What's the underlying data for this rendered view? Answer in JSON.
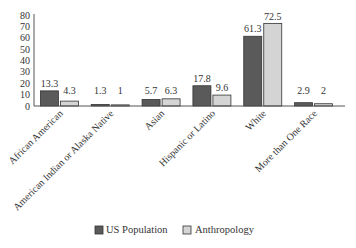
{
  "chart_data": {
    "type": "bar",
    "title": "",
    "xlabel": "",
    "ylabel": "",
    "ylim": [
      0,
      80
    ],
    "yticks": [
      0,
      10,
      20,
      30,
      40,
      50,
      60,
      70,
      80
    ],
    "grid": false,
    "legend_position": "bottom-center",
    "categories": [
      "African American",
      "American Indian or Alaska Native",
      "Asian",
      "Hispanic or Latino",
      "White",
      "More than One Race"
    ],
    "series": [
      {
        "name": "US Population",
        "color": "#5a5a5a",
        "values": [
          13.3,
          1.3,
          5.7,
          17.8,
          61.3,
          2.9
        ],
        "labels": [
          "13.3",
          "1.3",
          "5.7",
          "17.8",
          "61.3",
          "2.9"
        ]
      },
      {
        "name": "Anthropology",
        "color": "#d4d4d4",
        "values": [
          4.3,
          1,
          6.3,
          9.6,
          72.5,
          2
        ],
        "labels": [
          "4.3",
          "1",
          "6.3",
          "9.6",
          "72.5",
          "2"
        ]
      }
    ]
  }
}
